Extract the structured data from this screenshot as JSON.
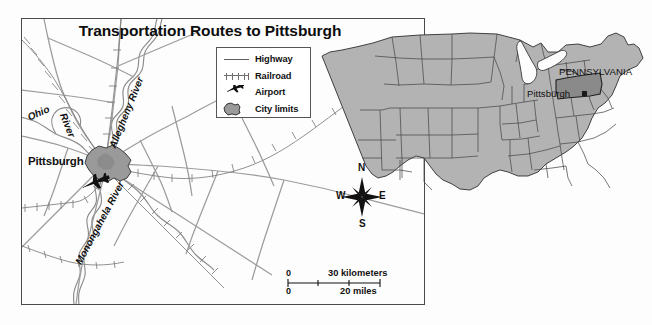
{
  "map": {
    "title": "Transportation Routes to Pittsburgh",
    "legend": {
      "title": "",
      "items": [
        {
          "symbol": "highway-line",
          "label": "Highway"
        },
        {
          "symbol": "railroad-line",
          "label": "Railroad"
        },
        {
          "symbol": "airplane-icon",
          "label": "Airport"
        },
        {
          "symbol": "city-limits-polygon",
          "label": "City limits"
        }
      ]
    },
    "compass": {
      "north": "N",
      "south": "S",
      "east": "E",
      "west": "W"
    },
    "scale_bar": {
      "kilometers": {
        "start": "0",
        "end": "30",
        "unit": "30 kilometers"
      },
      "miles": {
        "start": "0",
        "end": "20",
        "unit": "20 miles"
      }
    },
    "labels": {
      "city": "Pittsburgh",
      "river_ohio_1": "Ohio",
      "river_ohio_2": "River",
      "river_allegheny": "Allegheny River",
      "river_monongahela": "Monongahela River"
    }
  },
  "inset": {
    "state_label": "PENNSYLVANIA",
    "city_label": "Pittsburgh"
  },
  "colors": {
    "frame": "#4a4a4a",
    "land_fill": "#b3b3b3",
    "state_highlight": "#8a8a8a",
    "road": "#5d5d5d",
    "railroad": "#6e6e6e",
    "city_fill": "#9a9a9a",
    "text": "#111111",
    "background": "#fdfdfd"
  }
}
